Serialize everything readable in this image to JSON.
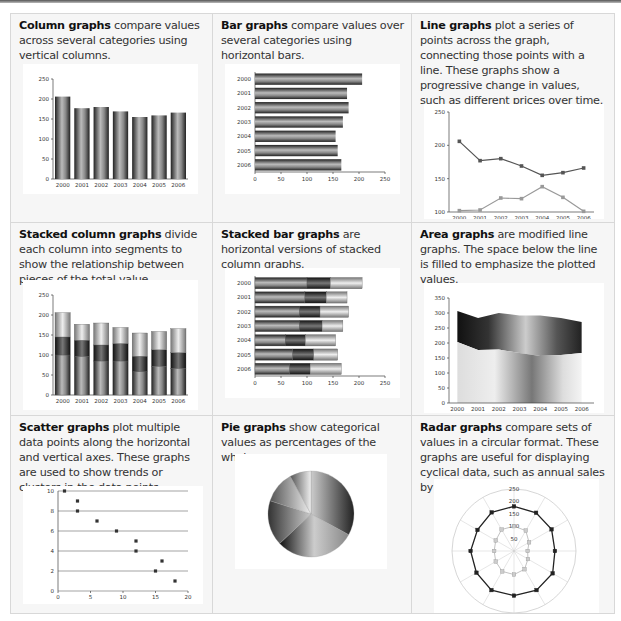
{
  "cells": [
    {
      "title": "Column graphs",
      "text": " compare values across several categories using vertical columns."
    },
    {
      "title": "Bar graphs",
      "text": " compare values over several categories using horizontal bars."
    },
    {
      "title": "Line graphs",
      "text": " plot a series of points across the graph, connecting those points with a line. These graphs show a progressive change in values, such as different prices over time."
    },
    {
      "title": "Stacked column graphs",
      "text": " divide each column into segments to show the relationship between pieces of the total value."
    },
    {
      "title": "Stacked bar graphs",
      "text": " are horizontal versions of stacked column graphs."
    },
    {
      "title": "Area graphs",
      "text": " are modified line graphs. The space below the line is filled to emphasize the plotted values."
    },
    {
      "title": "Scatter graphs",
      "text": " plot multiple data points along the horizontal and vertical axes. These graphs are used to show trends or clusters in the data points."
    },
    {
      "title": "Pie graphs",
      "text": " show categorical values as percentages of the whole."
    },
    {
      "title": "Radar graphs",
      "text": " compare sets of values in a circular format. These graphs are useful for displaying cyclical data, such as annual sales by month."
    }
  ],
  "chart_data": [
    {
      "type": "bar",
      "orientation": "vertical",
      "categories": [
        "2000",
        "2001",
        "2002",
        "2003",
        "2004",
        "2005",
        "2006"
      ],
      "values": [
        206,
        177,
        180,
        169,
        155,
        159,
        166
      ],
      "ylim": [
        0,
        250
      ],
      "yticks": [
        0,
        50,
        100,
        150,
        200,
        250
      ]
    },
    {
      "type": "bar",
      "orientation": "horizontal",
      "categories": [
        "2000",
        "2001",
        "2002",
        "2003",
        "2004",
        "2005",
        "2006"
      ],
      "values": [
        206,
        177,
        180,
        169,
        155,
        159,
        166
      ],
      "xlim": [
        0,
        250
      ],
      "xticks": [
        0,
        50,
        100,
        150,
        200,
        250
      ]
    },
    {
      "type": "line",
      "categories": [
        "2000",
        "2001",
        "2002",
        "2003",
        "2004",
        "2005",
        "2006"
      ],
      "series": [
        {
          "name": "upper",
          "values": [
            206,
            177,
            180,
            169,
            155,
            159,
            166
          ]
        },
        {
          "name": "lower",
          "values": [
            102,
            103,
            121,
            120,
            138,
            122,
            101
          ]
        }
      ],
      "ylim": [
        100,
        250
      ],
      "yticks": [
        100,
        150,
        200,
        250
      ]
    },
    {
      "type": "bar",
      "orientation": "vertical",
      "stacked": true,
      "categories": [
        "2000",
        "2001",
        "2002",
        "2003",
        "2004",
        "2005",
        "2006"
      ],
      "series": [
        {
          "name": "s1",
          "values": [
            100,
            96,
            85,
            85,
            58,
            72,
            66
          ]
        },
        {
          "name": "s2",
          "values": [
            45,
            41,
            40,
            44,
            39,
            41,
            40
          ]
        },
        {
          "name": "s3",
          "values": [
            61,
            40,
            55,
            40,
            58,
            46,
            60
          ]
        }
      ],
      "ylim": [
        0,
        250
      ],
      "yticks": [
        0,
        50,
        100,
        150,
        200,
        250
      ]
    },
    {
      "type": "bar",
      "orientation": "horizontal",
      "stacked": true,
      "categories": [
        "2000",
        "2001",
        "2002",
        "2003",
        "2004",
        "2005",
        "2006"
      ],
      "series": [
        {
          "name": "s1",
          "values": [
            100,
            96,
            85,
            85,
            58,
            72,
            66
          ]
        },
        {
          "name": "s2",
          "values": [
            45,
            41,
            40,
            44,
            39,
            41,
            40
          ]
        },
        {
          "name": "s3",
          "values": [
            61,
            40,
            55,
            40,
            58,
            46,
            60
          ]
        }
      ],
      "xlim": [
        0,
        250
      ],
      "xticks": [
        0,
        50,
        100,
        150,
        200,
        250
      ]
    },
    {
      "type": "area",
      "stacked": true,
      "categories": [
        "2000",
        "2001",
        "2002",
        "2003",
        "2004",
        "2005",
        "2006"
      ],
      "series": [
        {
          "name": "lower",
          "values": [
            203,
            177,
            178,
            167,
            157,
            160,
            167
          ]
        },
        {
          "name": "upper_total",
          "values": [
            307,
            283,
            300,
            292,
            292,
            283,
            270
          ]
        }
      ],
      "ylim": [
        0,
        350
      ],
      "yticks": [
        0,
        50,
        100,
        150,
        200,
        250,
        300,
        350
      ]
    },
    {
      "type": "scatter",
      "points": [
        [
          1,
          10
        ],
        [
          3,
          9
        ],
        [
          3,
          8
        ],
        [
          6,
          7
        ],
        [
          9,
          6
        ],
        [
          12,
          5
        ],
        [
          12,
          4
        ],
        [
          16,
          3
        ],
        [
          15,
          2
        ],
        [
          18,
          1
        ]
      ],
      "xlim": [
        0,
        20
      ],
      "ylim": [
        0,
        10
      ],
      "xticks": [
        0,
        5,
        10,
        15,
        20
      ],
      "yticks": [
        0,
        2,
        4,
        6,
        8,
        10
      ],
      "grid": true
    },
    {
      "type": "pie",
      "values": [
        33,
        30,
        17,
        12,
        8
      ]
    },
    {
      "type": "radar",
      "categories": [
        "1",
        "2",
        "3",
        "4",
        "5",
        "6",
        "7",
        "8",
        "9",
        "10",
        "11",
        "12"
      ],
      "series": [
        {
          "name": "outer",
          "values": [
            180,
            178,
            175,
            165,
            180,
            182,
            180,
            182,
            175,
            175,
            170,
            180
          ]
        },
        {
          "name": "inner",
          "values": [
            100,
            95,
            70,
            55,
            65,
            85,
            95,
            95,
            85,
            80,
            85,
            100
          ]
        }
      ],
      "rticks": [
        50,
        100,
        150,
        200,
        250
      ]
    }
  ]
}
